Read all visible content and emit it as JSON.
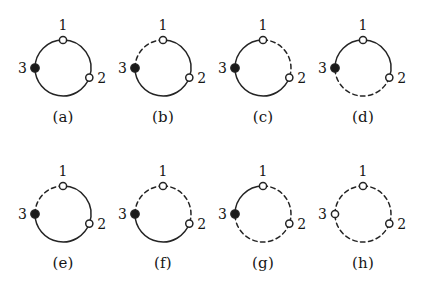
{
  "figure": {
    "columns": 4,
    "rows": 2,
    "node_labels": [
      "1",
      "2",
      "3"
    ],
    "colors": {
      "stroke": "#242424",
      "filled_node": "#1a1a1a",
      "open_node": "#ffffff",
      "background": "#ffffff",
      "text": "#161616"
    },
    "edge_styles": [
      "solid",
      "dashed"
    ],
    "node_styles": [
      "filled",
      "open"
    ],
    "panels": [
      {
        "caption": "(a)",
        "label_1": "1",
        "label_2": "2",
        "label_3": "3",
        "node1": "open",
        "node2": "open",
        "node3": "filled",
        "edge_31": "solid",
        "edge_12": "solid",
        "edge_23": "solid"
      },
      {
        "caption": "(b)",
        "label_1": "1",
        "label_2": "2",
        "label_3": "3",
        "node1": "open",
        "node2": "open",
        "node3": "filled",
        "edge_31": "dashed",
        "edge_12": "solid",
        "edge_23": "solid"
      },
      {
        "caption": "(c)",
        "label_1": "1",
        "label_2": "2",
        "label_3": "3",
        "node1": "open",
        "node2": "open",
        "node3": "filled",
        "edge_31": "solid",
        "edge_12": "dashed",
        "edge_23": "solid"
      },
      {
        "caption": "(d)",
        "label_1": "1",
        "label_2": "2",
        "label_3": "3",
        "node1": "open",
        "node2": "open",
        "node3": "filled",
        "edge_31": "solid",
        "edge_12": "solid",
        "edge_23": "dashed"
      },
      {
        "caption": "(e)",
        "label_1": "1",
        "label_2": "2",
        "label_3": "3",
        "node1": "open",
        "node2": "open",
        "node3": "filled",
        "edge_31": "dashed",
        "edge_12": "solid",
        "edge_23": "solid"
      },
      {
        "caption": "(f)",
        "label_1": "1",
        "label_2": "2",
        "label_3": "3",
        "node1": "open",
        "node2": "open",
        "node3": "filled",
        "edge_31": "dashed",
        "edge_12": "dashed",
        "edge_23": "solid"
      },
      {
        "caption": "(g)",
        "label_1": "1",
        "label_2": "2",
        "label_3": "3",
        "node1": "open",
        "node2": "open",
        "node3": "filled",
        "edge_31": "solid",
        "edge_12": "dashed",
        "edge_23": "dashed"
      },
      {
        "caption": "(h)",
        "label_1": "1",
        "label_2": "2",
        "label_3": "3",
        "node1": "open",
        "node2": "open",
        "node3": "open",
        "edge_31": "dashed",
        "edge_12": "dashed",
        "edge_23": "dashed"
      }
    ]
  }
}
